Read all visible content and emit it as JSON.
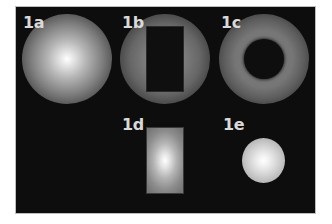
{
  "figure": {
    "background_color": "#0d0d0d",
    "panels": [
      {
        "id": "1a",
        "label": "1a",
        "description": "full radial gradient sphere, bright center fading to dark edge",
        "shape": "sphere",
        "center": [
          67,
          59
        ],
        "radius": 45
      },
      {
        "id": "1b",
        "label": "1b",
        "description": "dim radial sphere with dark rectangular cutout in center",
        "shape": "sphere-with-rect-hole",
        "center": [
          165,
          59
        ],
        "radius": 45,
        "hole": {
          "x": 147,
          "y": 27,
          "width": 36,
          "height": 64
        }
      },
      {
        "id": "1c",
        "label": "1c",
        "description": "dim radial sphere with dark circular cutout in center (ring)",
        "shape": "sphere-with-circle-hole",
        "center": [
          264,
          59
        ],
        "radius": 45,
        "hole": {
          "center": [
            264,
            59
          ],
          "radius": 20
        }
      },
      {
        "id": "1d",
        "label": "1d",
        "description": "rectangle filled with radial gradient, bright center",
        "shape": "glow-rect",
        "rect": {
          "x": 147,
          "y": 128,
          "width": 36,
          "height": 65
        }
      },
      {
        "id": "1e",
        "label": "1e",
        "description": "small bright sphere with radial gradient",
        "shape": "small-sphere",
        "center": [
          263,
          160
        ],
        "radius": 22
      }
    ]
  }
}
